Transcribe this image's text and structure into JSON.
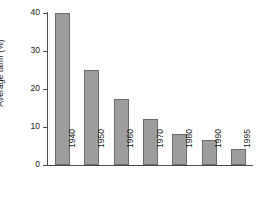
{
  "chart_data": {
    "type": "bar",
    "title": "",
    "xlabel": "",
    "ylabel": "Average tariff (%)",
    "categories": [
      "1940",
      "1950",
      "1960",
      "1970",
      "1980",
      "1990",
      "1995"
    ],
    "values": [
      40,
      25,
      17.4,
      12.1,
      8.2,
      6.6,
      4.2
    ],
    "ylim": [
      0,
      40
    ],
    "yticks": [
      "0",
      "10",
      "20",
      "30",
      "40"
    ],
    "ytick_values": [
      0,
      10,
      20,
      30,
      40
    ],
    "grid": false,
    "legend": null,
    "series": [
      {
        "name": "Average tariff",
        "values": [
          40,
          25,
          17.4,
          12.1,
          8.2,
          6.6,
          4.2
        ]
      }
    ],
    "colors": {
      "bar_fill": "#9d9d9d",
      "bar_edge": "#6b6b6b",
      "axis": "#4d4d4d",
      "text": "#1a1a1a",
      "background": "#ffffff"
    }
  }
}
